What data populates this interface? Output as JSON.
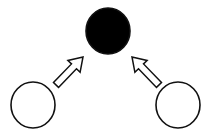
{
  "canvas": {
    "width": 208,
    "height": 139,
    "background": "#ffffff"
  },
  "colors": {
    "stroke": "#111111",
    "filled": "#000000",
    "hollow": "#ffffff"
  },
  "nodes": [
    {
      "id": "top",
      "label": "",
      "cx": 108,
      "cy": 31,
      "rx": 22,
      "ry": 23,
      "filled": true
    },
    {
      "id": "left",
      "label": "",
      "cx": 33,
      "cy": 105,
      "rx": 22,
      "ry": 23,
      "filled": false
    },
    {
      "id": "right",
      "label": "",
      "cx": 178,
      "cy": 105,
      "rx": 22,
      "ry": 23,
      "filled": false
    }
  ],
  "arrows": [
    {
      "id": "left-to-top",
      "from": "left",
      "to": "top",
      "x1": 56,
      "y1": 85,
      "x2": 83,
      "y2": 57,
      "style": "hollow-block"
    },
    {
      "id": "right-to-top",
      "from": "right",
      "to": "top",
      "x1": 159,
      "y1": 85,
      "x2": 132,
      "y2": 57,
      "style": "hollow-block"
    }
  ]
}
